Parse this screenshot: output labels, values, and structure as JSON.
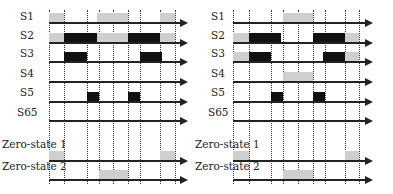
{
  "colors": {
    "high": "#111111",
    "gray": "#cfcfcf",
    "axis": "#222222"
  },
  "diagrams": [
    {
      "id": "left",
      "axis_start": 49,
      "axis_end": 180,
      "vlines": [
        49,
        64,
        87,
        99,
        113,
        128,
        140,
        160,
        175
      ],
      "vline_top": 10,
      "vline_bottom": 184,
      "label_x": 14,
      "signals": [
        {
          "label": "S1",
          "label_y": 11,
          "base_y": 22,
          "blocks": [
            {
              "x0": 49,
              "x1": 64,
              "kind": "gray"
            },
            {
              "x0": 97,
              "x1": 128,
              "kind": "gray"
            },
            {
              "x0": 160,
              "x1": 175,
              "kind": "gray"
            }
          ]
        },
        {
          "label": "S2",
          "label_y": 30,
          "base_y": 42,
          "blocks": [
            {
              "x0": 49,
              "x1": 64,
              "kind": "gray"
            },
            {
              "x0": 64,
              "x1": 97,
              "kind": "high"
            },
            {
              "x0": 97,
              "x1": 128,
              "kind": "gray"
            },
            {
              "x0": 128,
              "x1": 160,
              "kind": "high"
            },
            {
              "x0": 160,
              "x1": 175,
              "kind": "gray"
            }
          ]
        },
        {
          "label": "S3",
          "label_y": 48,
          "base_y": 61,
          "blocks": [
            {
              "x0": 64,
              "x1": 87,
              "kind": "high"
            },
            {
              "x0": 140,
              "x1": 162,
              "kind": "high"
            }
          ]
        },
        {
          "label": "S4",
          "label_y": 68,
          "base_y": 81,
          "blocks": []
        },
        {
          "label": "S5",
          "label_y": 87,
          "base_y": 101,
          "blocks": [
            {
              "x0": 87,
              "x1": 99,
              "kind": "high"
            },
            {
              "x0": 128,
              "x1": 140,
              "kind": "high"
            }
          ]
        },
        {
          "label": "S65",
          "label_y": 107,
          "base_y": 120,
          "blocks": []
        },
        {
          "label": "Zero-state 1",
          "label_y": 139,
          "base_y": 160,
          "blocks": [
            {
              "x0": 49,
              "x1": 64,
              "kind": "gray"
            },
            {
              "x0": 160,
              "x1": 175,
              "kind": "gray"
            }
          ]
        },
        {
          "label": "Zero-state 2",
          "label_y": 161,
          "base_y": 179,
          "blocks": [
            {
              "x0": 99,
              "x1": 128,
              "kind": "gray"
            }
          ]
        }
      ]
    },
    {
      "id": "right",
      "axis_start": 233,
      "axis_end": 365,
      "vlines": [
        233,
        249,
        271,
        283,
        298,
        313,
        325,
        345,
        359
      ],
      "vline_top": 10,
      "vline_bottom": 184,
      "label_x": 205,
      "signals": [
        {
          "label": "S1",
          "label_y": 11,
          "base_y": 22,
          "blocks": [
            {
              "x0": 283,
              "x1": 313,
              "kind": "gray"
            }
          ]
        },
        {
          "label": "S2",
          "label_y": 30,
          "base_y": 42,
          "blocks": [
            {
              "x0": 233,
              "x1": 249,
              "kind": "gray"
            },
            {
              "x0": 249,
              "x1": 281,
              "kind": "high"
            },
            {
              "x0": 313,
              "x1": 345,
              "kind": "high"
            },
            {
              "x0": 345,
              "x1": 359,
              "kind": "gray"
            }
          ]
        },
        {
          "label": "S3",
          "label_y": 48,
          "base_y": 61,
          "blocks": [
            {
              "x0": 233,
              "x1": 249,
              "kind": "gray"
            },
            {
              "x0": 249,
              "x1": 271,
              "kind": "high"
            },
            {
              "x0": 323,
              "x1": 345,
              "kind": "high"
            },
            {
              "x0": 345,
              "x1": 359,
              "kind": "gray"
            }
          ]
        },
        {
          "label": "S4",
          "label_y": 68,
          "base_y": 81,
          "blocks": [
            {
              "x0": 283,
              "x1": 313,
              "kind": "gray"
            }
          ]
        },
        {
          "label": "S5",
          "label_y": 87,
          "base_y": 101,
          "blocks": [
            {
              "x0": 271,
              "x1": 283,
              "kind": "high"
            },
            {
              "x0": 313,
              "x1": 325,
              "kind": "high"
            }
          ]
        },
        {
          "label": "S65",
          "label_y": 107,
          "base_y": 120,
          "blocks": []
        },
        {
          "label": "Zero-state 1",
          "label_y": 139,
          "base_y": 160,
          "blocks": [
            {
              "x0": 233,
              "x1": 249,
              "kind": "gray"
            },
            {
              "x0": 345,
              "x1": 359,
              "kind": "gray"
            }
          ]
        },
        {
          "label": "Zero-state 2",
          "label_y": 161,
          "base_y": 179,
          "blocks": [
            {
              "x0": 283,
              "x1": 313,
              "kind": "gray"
            }
          ]
        }
      ]
    }
  ]
}
